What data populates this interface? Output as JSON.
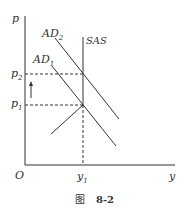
{
  "figure": {
    "axis_y_label": "p",
    "axis_x_label": "y",
    "origin_label": "O",
    "curves": {
      "ad2": {
        "label": "AD",
        "sub": "2"
      },
      "ad1": {
        "label": "AD",
        "sub": "1"
      },
      "sas": {
        "label": "SAS"
      }
    },
    "ticks": {
      "p2": {
        "label": "p",
        "sub": "2"
      },
      "p1": {
        "label": "p",
        "sub": "1"
      },
      "y1": {
        "label": "y",
        "sub": "1"
      }
    },
    "caption": {
      "prefix": "图",
      "number": "8-2"
    },
    "colors": {
      "line": "#333333"
    }
  }
}
